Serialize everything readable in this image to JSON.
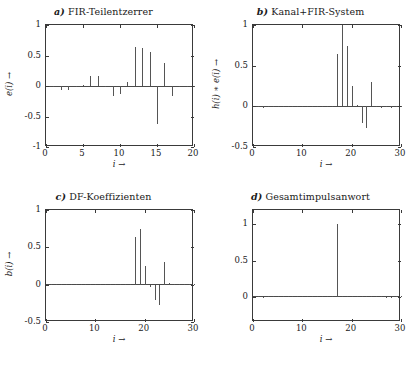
{
  "figure": {
    "caption": ""
  },
  "chart_data": [
    {
      "type": "bar",
      "panel": "a",
      "panel_label": "a)",
      "title": "FIR-Teilentzerrer",
      "xlabel": "i →",
      "ylabel": "e(i) →",
      "xlim": [
        0,
        20
      ],
      "ylim": [
        -1,
        1
      ],
      "xticks": [
        0,
        5,
        10,
        15,
        20
      ],
      "yticks": [
        -1,
        -0.5,
        0,
        0.5,
        1
      ],
      "ytick_labels": [
        "-1",
        "-0.5",
        "0",
        "0.5",
        "1"
      ],
      "xtick_labels": [
        "0",
        "5",
        "10",
        "15",
        "20"
      ],
      "grid": false,
      "legend": "none",
      "x": [
        1,
        2,
        3,
        4,
        5,
        6,
        7,
        8,
        9,
        10,
        11,
        12,
        13,
        14,
        15,
        16,
        17,
        18,
        19,
        20
      ],
      "values": [
        0.0,
        -0.07,
        -0.07,
        0.0,
        0.02,
        0.16,
        0.17,
        -0.01,
        -0.17,
        -0.13,
        0.07,
        0.64,
        0.62,
        0.55,
        -0.62,
        0.37,
        -0.17,
        0.0,
        0.0,
        0.0
      ]
    },
    {
      "type": "bar",
      "panel": "b",
      "panel_label": "b)",
      "title": "Kanal+FIR-System",
      "xlabel": "i →",
      "ylabel": "h(i) ∗ e(i) →",
      "xlim": [
        0,
        30
      ],
      "ylim": [
        -0.5,
        1
      ],
      "xticks": [
        0,
        10,
        20,
        30
      ],
      "yticks": [
        -0.5,
        0,
        0.5,
        1
      ],
      "ytick_labels": [
        "-0.5",
        "0",
        "0.5",
        "1"
      ],
      "xtick_labels": [
        "0",
        "10",
        "20",
        "30"
      ],
      "grid": false,
      "legend": "none",
      "x": [
        1,
        2,
        3,
        4,
        5,
        6,
        7,
        8,
        9,
        10,
        11,
        12,
        13,
        14,
        15,
        16,
        17,
        18,
        19,
        20,
        21,
        22,
        23,
        24,
        25,
        26,
        27,
        28,
        29,
        30
      ],
      "values": [
        0.0,
        -0.02,
        0.0,
        0.0,
        0.0,
        0.0,
        0.0,
        0.0,
        0.0,
        0.0,
        0.0,
        0.0,
        0.0,
        0.0,
        0.0,
        0.0,
        0.64,
        1.0,
        0.74,
        0.25,
        0.02,
        -0.2,
        -0.27,
        0.3,
        0.0,
        -0.02,
        0.0,
        -0.02,
        0.0,
        0.0
      ]
    },
    {
      "type": "bar",
      "panel": "c",
      "panel_label": "c)",
      "title": "DF-Koeffizienten",
      "xlabel": "i →",
      "ylabel": "b(i) →",
      "xlim": [
        0,
        30
      ],
      "ylim": [
        -0.5,
        1
      ],
      "xticks": [
        0,
        10,
        20,
        30
      ],
      "yticks": [
        -0.5,
        0,
        0.5,
        1
      ],
      "ytick_labels": [
        "-0.5",
        "0",
        "0.5",
        "1"
      ],
      "xtick_labels": [
        "0",
        "10",
        "20",
        "30"
      ],
      "grid": false,
      "legend": "none",
      "x": [
        1,
        2,
        3,
        4,
        5,
        6,
        7,
        8,
        9,
        10,
        11,
        12,
        13,
        14,
        15,
        16,
        17,
        18,
        19,
        20,
        21,
        22,
        23,
        24,
        25,
        26,
        27,
        28,
        29,
        30
      ],
      "values": [
        0.0,
        0.0,
        0.0,
        0.0,
        0.0,
        0.0,
        0.0,
        0.0,
        0.0,
        0.0,
        0.0,
        0.0,
        0.0,
        0.0,
        0.0,
        0.0,
        0.0,
        0.64,
        0.74,
        0.25,
        -0.03,
        -0.2,
        -0.27,
        0.3,
        0.02,
        0.0,
        0.0,
        0.0,
        0.0,
        0.0
      ]
    },
    {
      "type": "bar",
      "panel": "d",
      "panel_label": "d)",
      "title": "Gesamtimpulsanwort",
      "xlabel": "i →",
      "ylabel": "",
      "xlim": [
        0,
        30
      ],
      "ylim": [
        -0.35,
        1.2
      ],
      "xticks": [
        0,
        10,
        20,
        30
      ],
      "yticks": [
        0,
        0.5,
        1
      ],
      "ytick_labels": [
        "0",
        "0.5",
        "1"
      ],
      "xtick_labels": [
        "0",
        "10",
        "20",
        "30"
      ],
      "grid": false,
      "legend": "none",
      "x": [
        1,
        2,
        3,
        4,
        5,
        6,
        7,
        8,
        9,
        10,
        11,
        12,
        13,
        14,
        15,
        16,
        17,
        18,
        19,
        20,
        21,
        22,
        23,
        24,
        25,
        26,
        27,
        28,
        29,
        30
      ],
      "values": [
        0.0,
        -0.015,
        0.0,
        0.0,
        0.0,
        0.0,
        0.0,
        0.0,
        0.0,
        0.0,
        0.0,
        0.0,
        0.0,
        0.0,
        0.0,
        0.0,
        1.0,
        0.0,
        0.0,
        0.0,
        0.0,
        0.0,
        0.0,
        0.0,
        0.0,
        0.0,
        -0.015,
        -0.015,
        0.0,
        0.0
      ]
    }
  ]
}
